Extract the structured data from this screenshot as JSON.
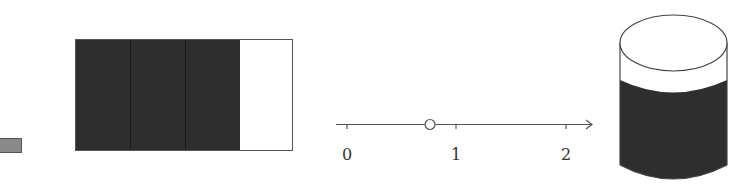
{
  "figure": {
    "small_bar": {
      "color": "#8a8a8a",
      "border": "#555555"
    },
    "fraction_rectangle": {
      "total_parts": 4,
      "shaded_parts": 3,
      "shade_color": "#2e2e2e",
      "border_color": "#555555"
    },
    "number_line": {
      "ticks": [
        {
          "value": 0,
          "label": "0"
        },
        {
          "value": 1,
          "label": "1"
        },
        {
          "value": 2,
          "label": "2"
        }
      ],
      "open_point_value": 0.75,
      "line_color": "#555555"
    },
    "cylinder": {
      "fill_fraction": 0.75,
      "liquid_color": "#2e2e2e",
      "outline_color": "#444444"
    }
  }
}
